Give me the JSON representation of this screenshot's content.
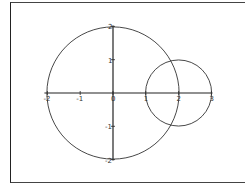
{
  "chart_data": {
    "type": "line",
    "title": "",
    "xlabel": "",
    "ylabel": "",
    "xlim": [
      -2,
      3
    ],
    "ylim": [
      -2,
      2
    ],
    "grid": false,
    "legend": null,
    "x_ticks": [
      "-2",
      "-1",
      "0",
      "1",
      "2",
      "3"
    ],
    "y_ticks": [
      "2",
      "1",
      "0",
      "-1",
      "-2"
    ],
    "series": [
      {
        "name": "circle-large",
        "shape": "circle",
        "center": [
          0,
          0
        ],
        "radius": 2,
        "color": "#333333"
      },
      {
        "name": "circle-small",
        "shape": "circle",
        "center": [
          2,
          0
        ],
        "radius": 1,
        "color": "#333333"
      }
    ],
    "axis_color": "#222222"
  }
}
